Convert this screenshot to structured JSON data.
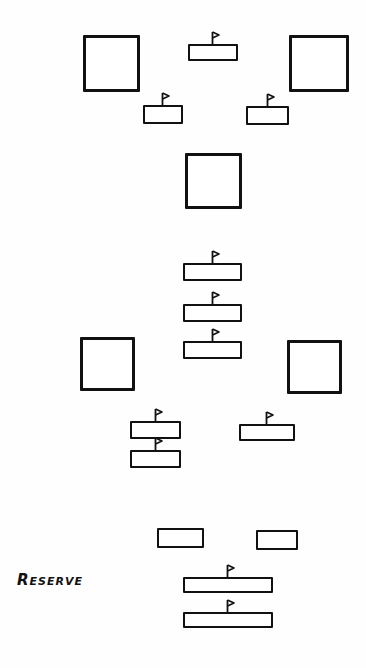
{
  "diagram": {
    "title": "",
    "colors": {
      "stroke": "#111111",
      "background": "#ffffff"
    },
    "label": {
      "text": "Reserve",
      "x": 17,
      "y": 571
    },
    "squares": [
      {
        "id": "square-top-left",
        "x": 83,
        "y": 35,
        "w": 57,
        "h": 57
      },
      {
        "id": "square-top-right",
        "x": 289,
        "y": 35,
        "w": 60,
        "h": 57
      },
      {
        "id": "square-center",
        "x": 185,
        "y": 153,
        "w": 57,
        "h": 56
      },
      {
        "id": "square-lower-left",
        "x": 80,
        "y": 337,
        "w": 55,
        "h": 54
      },
      {
        "id": "square-lower-right",
        "x": 287,
        "y": 340,
        "w": 55,
        "h": 54
      }
    ],
    "bars": [
      {
        "id": "bar-top-center",
        "x": 188,
        "y": 44,
        "w": 50,
        "h": 17,
        "flag": true
      },
      {
        "id": "bar-upper-left",
        "x": 143,
        "y": 105,
        "w": 40,
        "h": 19,
        "flag": true
      },
      {
        "id": "bar-upper-right",
        "x": 246,
        "y": 106,
        "w": 43,
        "h": 19,
        "flag": true
      },
      {
        "id": "bar-stack-1",
        "x": 183,
        "y": 263,
        "w": 59,
        "h": 18,
        "flag": true
      },
      {
        "id": "bar-stack-2",
        "x": 183,
        "y": 304,
        "w": 59,
        "h": 18,
        "flag": true
      },
      {
        "id": "bar-stack-3",
        "x": 183,
        "y": 341,
        "w": 59,
        "h": 18,
        "flag": true
      },
      {
        "id": "bar-lower-left-1",
        "x": 130,
        "y": 421,
        "w": 51,
        "h": 18,
        "flag": true
      },
      {
        "id": "bar-lower-left-2",
        "x": 130,
        "y": 450,
        "w": 51,
        "h": 18,
        "flag": true
      },
      {
        "id": "bar-lower-right",
        "x": 239,
        "y": 424,
        "w": 56,
        "h": 17,
        "flag": true
      },
      {
        "id": "bar-plain-left",
        "x": 157,
        "y": 528,
        "w": 47,
        "h": 20,
        "flag": false
      },
      {
        "id": "bar-plain-right",
        "x": 256,
        "y": 530,
        "w": 42,
        "h": 20,
        "flag": false
      },
      {
        "id": "bar-reserve-1",
        "x": 183,
        "y": 577,
        "w": 90,
        "h": 16,
        "flag": true
      },
      {
        "id": "bar-reserve-2",
        "x": 183,
        "y": 612,
        "w": 90,
        "h": 16,
        "flag": true
      }
    ]
  }
}
